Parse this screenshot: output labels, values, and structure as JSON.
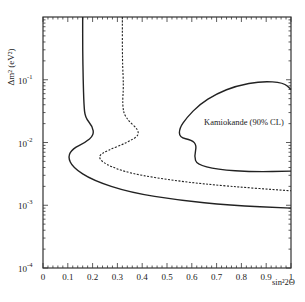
{
  "chart_data": {
    "type": "line",
    "title": "",
    "xlabel": "sin²2Θ",
    "ylabel": "Δm² (eV²)",
    "xlim": [
      0,
      1
    ],
    "ylim": [
      0.0001,
      1
    ],
    "yscale": "log",
    "grid": false,
    "x_ticks": [
      "0",
      "0.1",
      "0.2",
      "0.3",
      "0.4",
      "0.5",
      "0.6",
      "0.7",
      "0.8",
      "0.9",
      "1"
    ],
    "y_ticks": [
      "10^-4",
      "10^-3",
      "10^-2",
      "10^-1"
    ],
    "annotations": [
      {
        "text": "Kamiokande (90% CL)",
        "x": 0.6,
        "y": 0.035
      }
    ],
    "series": [
      {
        "name": "solid exclusion contour",
        "style": "solid",
        "points": [
          [
            0.16,
            1.0
          ],
          [
            0.16,
            0.3
          ],
          [
            0.162,
            0.1
          ],
          [
            0.165,
            0.04
          ],
          [
            0.17,
            0.025
          ],
          [
            0.2,
            0.018
          ],
          [
            0.205,
            0.013
          ],
          [
            0.17,
            0.01
          ],
          [
            0.12,
            0.008
          ],
          [
            0.1,
            0.006
          ],
          [
            0.12,
            0.004
          ],
          [
            0.2,
            0.0025
          ],
          [
            0.35,
            0.0016
          ],
          [
            0.55,
            0.0012
          ],
          [
            0.75,
            0.001
          ],
          [
            1.0,
            0.0009
          ]
        ]
      },
      {
        "name": "dashed exclusion contour",
        "style": "dashed",
        "points": [
          [
            0.32,
            1.0
          ],
          [
            0.32,
            0.2
          ],
          [
            0.325,
            0.08
          ],
          [
            0.32,
            0.04
          ],
          [
            0.33,
            0.025
          ],
          [
            0.4,
            0.014
          ],
          [
            0.34,
            0.01
          ],
          [
            0.26,
            0.0075
          ],
          [
            0.22,
            0.006
          ],
          [
            0.25,
            0.0045
          ],
          [
            0.35,
            0.0032
          ],
          [
            0.55,
            0.0024
          ],
          [
            0.75,
            0.002
          ],
          [
            1.0,
            0.0017
          ]
        ]
      },
      {
        "name": "Kamiokande (90% CL)",
        "style": "solid-closed",
        "points": [
          [
            1.0,
            0.07
          ],
          [
            0.97,
            0.09
          ],
          [
            0.88,
            0.095
          ],
          [
            0.78,
            0.08
          ],
          [
            0.7,
            0.06
          ],
          [
            0.63,
            0.04
          ],
          [
            0.58,
            0.025
          ],
          [
            0.55,
            0.017
          ],
          [
            0.55,
            0.012
          ],
          [
            0.6,
            0.011
          ],
          [
            0.62,
            0.009
          ],
          [
            0.61,
            0.006
          ],
          [
            0.62,
            0.0045
          ],
          [
            0.7,
            0.0037
          ],
          [
            0.85,
            0.0034
          ],
          [
            1.0,
            0.0035
          ]
        ]
      }
    ]
  },
  "labels": {
    "xlabel": "sin²2Θ",
    "ylabel": "Δm² (eV²)",
    "annotation": "Kamiokande (90% CL)",
    "yticks": [
      "10",
      "10",
      "10",
      "10"
    ],
    "yexp": [
      "-1",
      "-2",
      "-3",
      "-4"
    ],
    "xticks": [
      "0",
      "0.1",
      "0.2",
      "0.3",
      "0.4",
      "0.5",
      "0.6",
      "0.7",
      "0.8",
      "0.9",
      "1"
    ]
  }
}
